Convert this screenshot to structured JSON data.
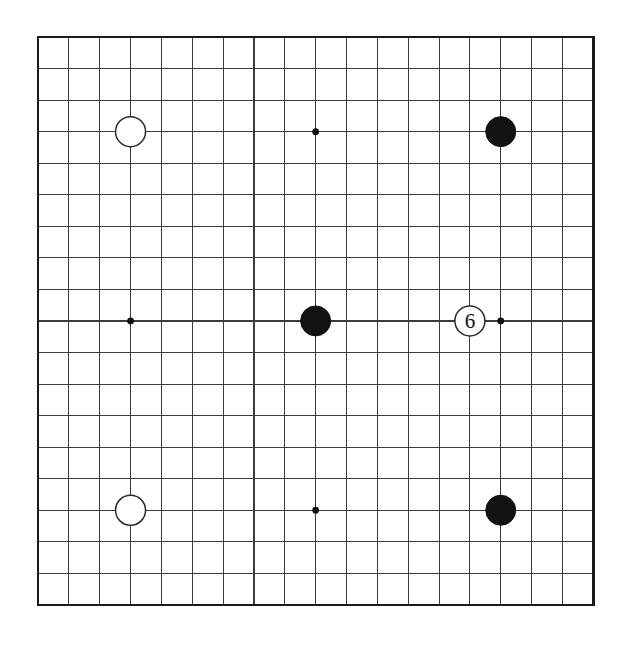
{
  "diagram": {
    "board_size": 19,
    "board": {
      "left": 38,
      "top": 37,
      "cell_w": 30.85,
      "cell_h": 31.55,
      "line_color": "#3c3c3c",
      "border_color": "#1a1a1a",
      "background": "#ffffff"
    },
    "star_points": [
      {
        "col": 4,
        "row": 4
      },
      {
        "col": 10,
        "row": 4
      },
      {
        "col": 16,
        "row": 4
      },
      {
        "col": 4,
        "row": 10
      },
      {
        "col": 10,
        "row": 10
      },
      {
        "col": 16,
        "row": 10
      },
      {
        "col": 4,
        "row": 16
      },
      {
        "col": 10,
        "row": 16
      },
      {
        "col": 16,
        "row": 16
      }
    ],
    "visible_star_dots": [
      {
        "col": 10,
        "row": 4
      },
      {
        "col": 4,
        "row": 10
      },
      {
        "col": 16,
        "row": 10
      },
      {
        "col": 10,
        "row": 16
      }
    ],
    "star_dot_radius": 3.4,
    "stone_radius": 15,
    "stones": [
      {
        "col": 4,
        "row": 4,
        "color": "white",
        "label": ""
      },
      {
        "col": 16,
        "row": 4,
        "color": "black",
        "label": ""
      },
      {
        "col": 10,
        "row": 10,
        "color": "black",
        "label": ""
      },
      {
        "col": 15,
        "row": 10,
        "color": "white",
        "label": "6"
      },
      {
        "col": 4,
        "row": 16,
        "color": "white",
        "label": ""
      },
      {
        "col": 16,
        "row": 16,
        "color": "black",
        "label": ""
      }
    ],
    "colors": {
      "black_stone": "#121212",
      "white_stone": "#ffffff",
      "white_stone_outline": "#2a2a2a",
      "label_text": "#111111"
    }
  }
}
